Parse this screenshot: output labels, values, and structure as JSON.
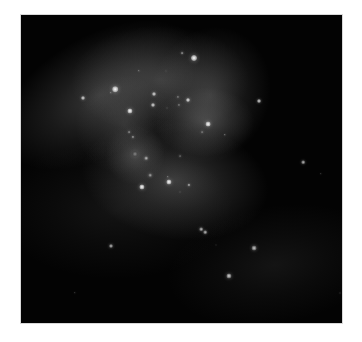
{
  "image": {
    "subject": "interacting-galaxies",
    "colors": {
      "background": "#ffffff",
      "sky": "#030303",
      "nebula": "#9a9a9a",
      "star": "#ffffff"
    },
    "sky_box": {
      "x": 21,
      "y": 15,
      "width": 321,
      "height": 308
    },
    "glows": [
      {
        "x": 100,
        "y": 95,
        "w": 110,
        "h": 60,
        "o": 0.3,
        "rot": -30
      },
      {
        "x": 160,
        "y": 80,
        "w": 90,
        "h": 55,
        "o": 0.28,
        "rot": 0
      },
      {
        "x": 210,
        "y": 95,
        "w": 60,
        "h": 70,
        "o": 0.28,
        "rot": 20
      },
      {
        "x": 205,
        "y": 122,
        "w": 50,
        "h": 35,
        "o": 0.3,
        "rot": 0
      },
      {
        "x": 125,
        "y": 125,
        "w": 50,
        "h": 50,
        "o": 0.22,
        "rot": 0
      },
      {
        "x": 175,
        "y": 180,
        "w": 95,
        "h": 60,
        "o": 0.33,
        "rot": 10
      },
      {
        "x": 135,
        "y": 155,
        "w": 30,
        "h": 30,
        "o": 0.25,
        "rot": 0
      },
      {
        "x": 115,
        "y": 210,
        "w": 120,
        "h": 70,
        "o": 0.1,
        "rot": 0
      },
      {
        "x": 275,
        "y": 265,
        "w": 110,
        "h": 60,
        "o": 0.1,
        "rot": -10
      }
    ],
    "stars": [
      {
        "x": 194,
        "y": 58,
        "r": 3.0,
        "b": 1.0
      },
      {
        "x": 182,
        "y": 53,
        "r": 1.4,
        "b": 0.6
      },
      {
        "x": 139,
        "y": 71,
        "r": 1.2,
        "b": 0.5
      },
      {
        "x": 115,
        "y": 89,
        "r": 2.8,
        "b": 1.0
      },
      {
        "x": 111,
        "y": 93,
        "r": 1.2,
        "b": 0.5
      },
      {
        "x": 83,
        "y": 98,
        "r": 2.0,
        "b": 0.85
      },
      {
        "x": 154,
        "y": 94,
        "r": 2.0,
        "b": 0.85
      },
      {
        "x": 153,
        "y": 105,
        "r": 2.0,
        "b": 0.85
      },
      {
        "x": 188,
        "y": 100,
        "r": 2.0,
        "b": 0.9
      },
      {
        "x": 178,
        "y": 97,
        "r": 1.6,
        "b": 0.45
      },
      {
        "x": 179,
        "y": 105,
        "r": 1.6,
        "b": 0.45
      },
      {
        "x": 167,
        "y": 108,
        "r": 1.0,
        "b": 0.35
      },
      {
        "x": 130,
        "y": 111,
        "r": 2.6,
        "b": 1.0
      },
      {
        "x": 259,
        "y": 101,
        "r": 2.0,
        "b": 0.85
      },
      {
        "x": 208,
        "y": 124,
        "r": 2.4,
        "b": 1.0
      },
      {
        "x": 202,
        "y": 132,
        "r": 1.4,
        "b": 0.45
      },
      {
        "x": 225,
        "y": 135,
        "r": 1.2,
        "b": 0.5
      },
      {
        "x": 129,
        "y": 132,
        "r": 1.4,
        "b": 0.55
      },
      {
        "x": 133,
        "y": 137,
        "r": 1.6,
        "b": 0.6
      },
      {
        "x": 135,
        "y": 154,
        "r": 3.0,
        "b": 0.35
      },
      {
        "x": 146,
        "y": 158,
        "r": 1.8,
        "b": 0.7
      },
      {
        "x": 180,
        "y": 156,
        "r": 1.4,
        "b": 0.4
      },
      {
        "x": 150,
        "y": 175,
        "r": 1.8,
        "b": 0.6
      },
      {
        "x": 169,
        "y": 182,
        "r": 2.6,
        "b": 1.0
      },
      {
        "x": 168,
        "y": 177,
        "r": 1.2,
        "b": 0.5
      },
      {
        "x": 142,
        "y": 187,
        "r": 2.6,
        "b": 1.0
      },
      {
        "x": 189,
        "y": 185,
        "r": 1.6,
        "b": 0.7
      },
      {
        "x": 180,
        "y": 192,
        "r": 1.0,
        "b": 0.35
      },
      {
        "x": 303,
        "y": 162,
        "r": 1.8,
        "b": 0.75
      },
      {
        "x": 321,
        "y": 174,
        "r": 1.2,
        "b": 0.3
      },
      {
        "x": 201,
        "y": 229,
        "r": 1.8,
        "b": 0.75
      },
      {
        "x": 205,
        "y": 232,
        "r": 1.8,
        "b": 0.75
      },
      {
        "x": 111,
        "y": 246,
        "r": 2.0,
        "b": 0.75
      },
      {
        "x": 216,
        "y": 245,
        "r": 1.0,
        "b": 0.25
      },
      {
        "x": 254,
        "y": 248,
        "r": 2.4,
        "b": 0.8
      },
      {
        "x": 229,
        "y": 276,
        "r": 2.6,
        "b": 0.85
      },
      {
        "x": 75,
        "y": 293,
        "r": 1.2,
        "b": 0.3
      },
      {
        "x": 340,
        "y": 293,
        "r": 1.0,
        "b": 0.3
      },
      {
        "x": 166,
        "y": 71,
        "r": 1.0,
        "b": 0.3
      }
    ]
  }
}
